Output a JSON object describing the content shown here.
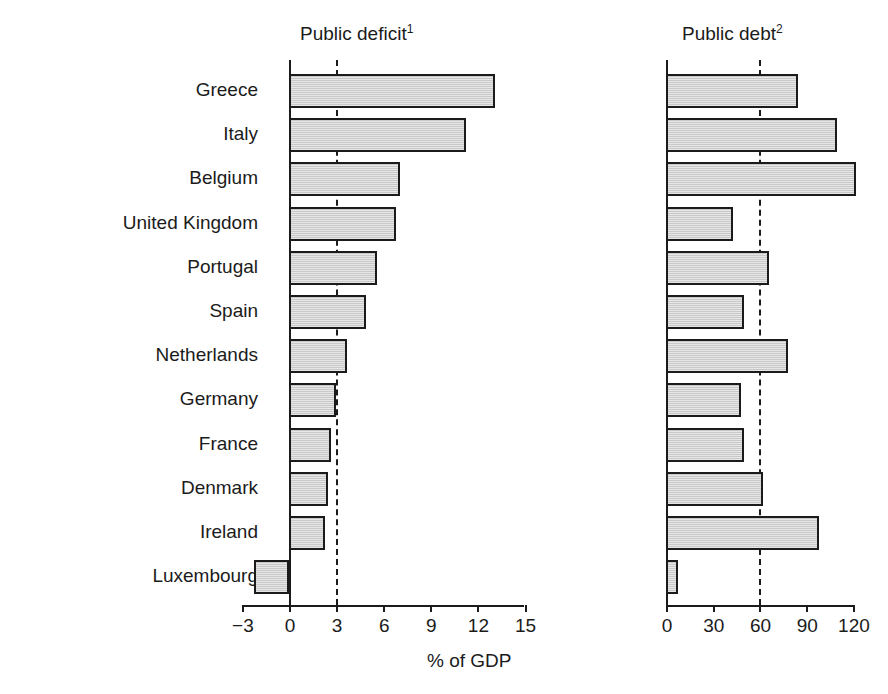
{
  "chart_data": {
    "type": "bar",
    "title": "",
    "orientation": "horizontal",
    "grid": false,
    "legend": false,
    "xlabel": "% of GDP",
    "ylabel": "",
    "categories": [
      "Greece",
      "Italy",
      "Belgium",
      "United Kingdom",
      "Portugal",
      "Spain",
      "Netherlands",
      "Germany",
      "France",
      "Denmark",
      "Ireland",
      "Luxembourg"
    ],
    "panels": [
      {
        "name": "deficit",
        "title": "Public deficit",
        "title_superscript": "1",
        "values": [
          13.1,
          11.3,
          7.1,
          6.8,
          5.6,
          4.9,
          3.7,
          3.0,
          2.7,
          2.5,
          2.3,
          -2.2
        ],
        "xlim": [
          -3,
          15
        ],
        "ticks": [
          -3,
          0,
          3,
          6,
          9,
          12,
          15
        ],
        "tick_labels": [
          "−3",
          "0",
          "3",
          "6",
          "9",
          "12",
          "15"
        ],
        "reference_line": 3
      },
      {
        "name": "debt",
        "title": "Public debt",
        "title_superscript": "2",
        "values": [
          85,
          110,
          122,
          43,
          66,
          50,
          78,
          48,
          50,
          62,
          98,
          8
        ],
        "xlim": [
          0,
          130
        ],
        "ticks": [
          0,
          30,
          60,
          90,
          120
        ],
        "tick_labels": [
          "0",
          "30",
          "60",
          "90",
          "120"
        ],
        "reference_line": 60
      }
    ],
    "colors": {
      "bar_fill": "#c9c9c9",
      "bar_border": "#1b1b1b",
      "axis": "#1b1b1b",
      "text": "#1b1b1b",
      "background": "#ffffff"
    }
  }
}
